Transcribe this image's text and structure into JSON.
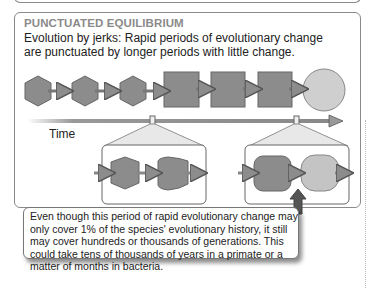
{
  "panel": {
    "heading": "PUNCTUATED EQUILIBRIUM",
    "subtitle": "Evolution by jerks: Rapid periods of evolutionary change are punctuated by longer periods with little change."
  },
  "timeline": {
    "label": "Time",
    "stages": [
      "hexagon",
      "hexagon",
      "hexagon",
      "square",
      "square",
      "square",
      "circle"
    ]
  },
  "zoom_insets": [
    {
      "shapes": [
        "hexagon",
        "rounded-hexagon"
      ]
    },
    {
      "shapes": [
        "rounded-square",
        "rounded-circle"
      ]
    }
  ],
  "callout": {
    "text": "Even though this period of rapid evolutionary change may only cover 1% of the species' evolutionary history, it still may cover hundreds or thousands of generations. This could take tens of thousands of years in a primate or a matter of months in bacteria."
  },
  "colors": {
    "dark_shape": "#8c8c8c",
    "light_shape": "#c4c4c4",
    "outline": "#666666",
    "border": "#8a8a8a",
    "heading": "#8a8a8a"
  }
}
